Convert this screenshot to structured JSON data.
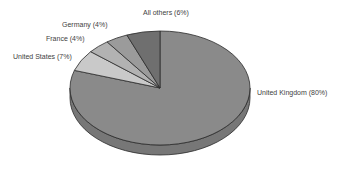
{
  "chart_data": {
    "type": "pie",
    "title": "",
    "subtitle": "",
    "xlabel": "",
    "ylabel": "",
    "grid": false,
    "legend_position": "none",
    "label_style": "outside-with-percent",
    "three_d": true,
    "categories": [
      "United Kingdom",
      "All others",
      "Germany",
      "France",
      "United States"
    ],
    "values": [
      80,
      6,
      4,
      4,
      7
    ],
    "units": "%",
    "slices": [
      {
        "name": "United Kingdom",
        "label": "United Kingdom (80%)",
        "value": 80,
        "percent": "80%",
        "color": "#8a8a8a",
        "side_color": "#777777",
        "start_angle_deg": 0,
        "end_angle_deg": 288
      },
      {
        "name": "All others",
        "label": "All others (6%)",
        "value": 6,
        "percent": "6%",
        "color": "#c9c9c9",
        "side_color": "#b0b0b0",
        "start_angle_deg": 288,
        "end_angle_deg": 309.6
      },
      {
        "name": "Germany",
        "label": "Germany (4%)",
        "value": 4,
        "percent": "4%",
        "color": "#b2b2b2",
        "side_color": "#9c9c9c",
        "start_angle_deg": 309.6,
        "end_angle_deg": 324
      },
      {
        "name": "France",
        "label": "France (4%)",
        "value": 4,
        "percent": "4%",
        "color": "#9b9b9b",
        "side_color": "#878787",
        "start_angle_deg": 324,
        "end_angle_deg": 338.4
      },
      {
        "name": "United States",
        "label": "United States (7%)",
        "value": 7,
        "percent": "7%",
        "color": "#6f6f6f",
        "side_color": "#606060",
        "start_angle_deg": 338.4,
        "end_angle_deg": 360
      }
    ],
    "colors": {
      "outline": "#2b2b2b",
      "background": "#ffffff",
      "text": "#414141"
    },
    "geometry": {
      "center_x": 160,
      "center_y": 88,
      "radius_x": 90,
      "radius_y": 57,
      "depth": 10
    }
  }
}
